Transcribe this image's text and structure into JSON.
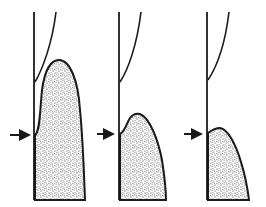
{
  "diagram": {
    "background": "#ffffff",
    "ink_color": "#1a1a1a",
    "stipple_color": "#2a2a2a",
    "panels": [
      {
        "id": "panel-1",
        "vertical_line": {
          "x": 34,
          "y1": 12,
          "y2": 200
        },
        "curve": "M35,82 C42,70 52,45 56,12",
        "fill_region": "M35,200 L35,135 C40,132 40,110 42,90 C45,68 52,60 59,60 C70,60 78,80 80,110 C83,140 84,175 85,200 Z",
        "arrow": {
          "x1": 10,
          "x2": 33,
          "y": 135
        }
      },
      {
        "id": "panel-2",
        "vertical_line": {
          "x": 119,
          "y1": 12,
          "y2": 200
        },
        "curve": "M120,82 C128,70 137,45 141,12",
        "fill_region": "M120,200 L120,134 C125,132 127,122 130,118 C133,114 136,113 140,114 C150,118 158,140 162,160 C165,180 166,192 166,200 Z",
        "arrow": {
          "x1": 97,
          "x2": 117,
          "y": 134
        }
      },
      {
        "id": "panel-3",
        "vertical_line": {
          "x": 207,
          "y1": 12,
          "y2": 200
        },
        "curve": "M208,80 C216,68 225,45 229,12",
        "fill_region": "M208,200 L208,133 C212,130 215,128 220,128 C228,129 236,145 241,162 C246,178 248,192 249,200 Z",
        "arrow": {
          "x1": 184,
          "x2": 205,
          "y": 134
        }
      }
    ]
  }
}
